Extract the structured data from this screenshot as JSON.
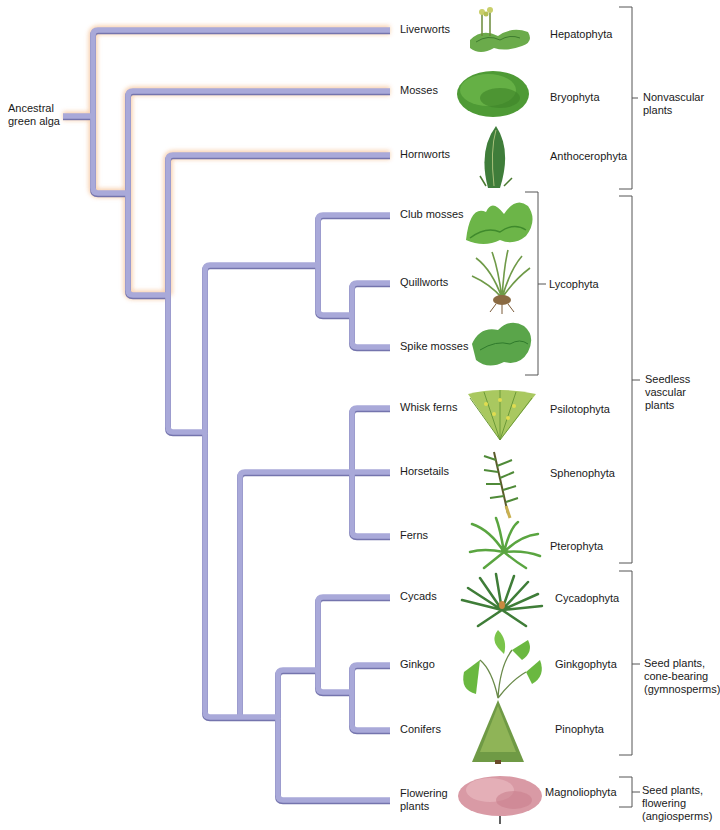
{
  "diagram": {
    "type": "phylogenetic_tree",
    "root": {
      "label": "Ancestral green alga"
    },
    "taxa": [
      {
        "common": "Liverworts",
        "phylum": "Hepatophyta",
        "y": 30
      },
      {
        "common": "Mosses",
        "phylum": "Bryophyta",
        "y": 91
      },
      {
        "common": "Hornworts",
        "phylum": "Anthocerophyta",
        "y": 155
      },
      {
        "common": "Club mosses",
        "phylum": "",
        "y": 215
      },
      {
        "common": "Quillworts",
        "phylum": "Lycophyta",
        "y": 283
      },
      {
        "common": "Spike mosses",
        "phylum": "",
        "y": 347
      },
      {
        "common": "Whisk ferns",
        "phylum": "Psilotophyta",
        "y": 408
      },
      {
        "common": "Horsetails",
        "phylum": "Sphenophyta",
        "y": 472
      },
      {
        "common": "Ferns",
        "phylum": "Pterophyta",
        "y": 536
      },
      {
        "common": "Cycads",
        "phylum": "Cycadophyta",
        "y": 597
      },
      {
        "common": "Ginkgo",
        "phylum": "Ginkgophyta",
        "y": 665
      },
      {
        "common": "Conifers",
        "phylum": "Pinophyta",
        "y": 730
      },
      {
        "common": "Flowering plants",
        "phylum": "Magnoliophyta",
        "y": 800
      }
    ],
    "labels": {
      "root_line1": "Ancestral",
      "root_line2": "green alga",
      "liverworts": "Liverworts",
      "mosses": "Mosses",
      "hornworts": "Hornworts",
      "club_mosses": "Club mosses",
      "quillworts": "Quillworts",
      "spike_mosses": "Spike mosses",
      "whisk_ferns": "Whisk ferns",
      "horsetails": "Horsetails",
      "ferns": "Ferns",
      "cycads": "Cycads",
      "ginkgo": "Ginkgo",
      "conifers": "Conifers",
      "flowering_line1": "Flowering",
      "flowering_line2": "plants"
    },
    "phyla": {
      "hepatophyta": "Hepatophyta",
      "bryophyta": "Bryophyta",
      "anthocerophyta": "Anthocerophyta",
      "lycophyta": "Lycophyta",
      "psilotophyta": "Psilotophyta",
      "sphenophyta": "Sphenophyta",
      "pterophyta": "Pterophyta",
      "cycadophyta": "Cycadophyta",
      "ginkgophyta": "Ginkgophyta",
      "pinophyta": "Pinophyta",
      "magnoliophyta": "Magnoliophyta"
    },
    "groups": {
      "nonvascular": {
        "line1": "Nonvascular",
        "line2": "plants"
      },
      "seedless": {
        "line1": "Seedless",
        "line2": "vascular",
        "line3": "plants"
      },
      "gymnosperms": {
        "line1": "Seed plants,",
        "line2": "cone-bearing",
        "line3": "(gymnosperms)"
      },
      "angiosperms": {
        "line1": "Seed plants,",
        "line2": "flowering",
        "line3": "(angiosperms)"
      }
    },
    "colors": {
      "branch": "#a9a9d9",
      "branch_shadow": "#7474ad",
      "glow": "#f6c8a0",
      "bracket": "#555555",
      "plant_green": "#4f9a3a",
      "plant_light_green": "#8fc85a",
      "flowering_pink": "#d99aa5"
    }
  }
}
